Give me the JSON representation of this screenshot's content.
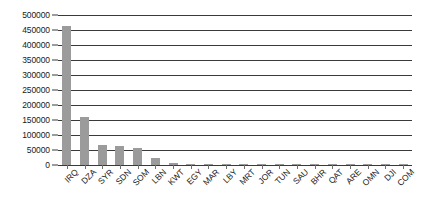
{
  "chart_data": {
    "type": "bar",
    "title": "",
    "xlabel": "",
    "ylabel": "",
    "ylim": [
      0,
      500000
    ],
    "grid": true,
    "legend": "none",
    "categories": [
      "IRQ",
      "DZA",
      "SYR",
      "SDN",
      "SOM",
      "LBN",
      "KWT",
      "EGY",
      "MAR",
      "LBY",
      "MRT",
      "JOR",
      "TUN",
      "SAU",
      "BHR",
      "QAT",
      "ARE",
      "OMN",
      "DJI",
      "COM"
    ],
    "values": [
      465000,
      160000,
      68000,
      62000,
      57000,
      25000,
      6000,
      4000,
      1200,
      900,
      700,
      500,
      400,
      300,
      250,
      200,
      150,
      120,
      80,
      50
    ],
    "ytick_labels": [
      "0",
      "50000",
      "100000",
      "150000",
      "200000",
      "250000",
      "300000",
      "350000",
      "400000",
      "450000",
      "500000"
    ],
    "ytick_values": [
      0,
      50000,
      100000,
      150000,
      200000,
      250000,
      300000,
      350000,
      400000,
      450000,
      500000
    ],
    "bar_color": "#9b9b9b",
    "axis_color": "#3a3a3a",
    "background_color": "#ffffff"
  }
}
